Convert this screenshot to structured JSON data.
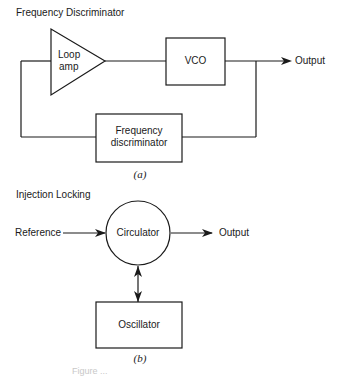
{
  "diagram_a": {
    "title": "Frequency Discriminator",
    "loop_amp": {
      "line1": "Loop",
      "line2": "amp"
    },
    "vco": "VCO",
    "output": "Output",
    "discriminator": {
      "line1": "Frequency",
      "line2": "discriminator"
    },
    "sublabel": "(a)"
  },
  "diagram_b": {
    "title": "Injection Locking",
    "reference": "Reference",
    "circulator": "Circulator",
    "output": "Output",
    "oscillator": "Oscillator",
    "sublabel": "(b)"
  },
  "caption": "Figure ..."
}
